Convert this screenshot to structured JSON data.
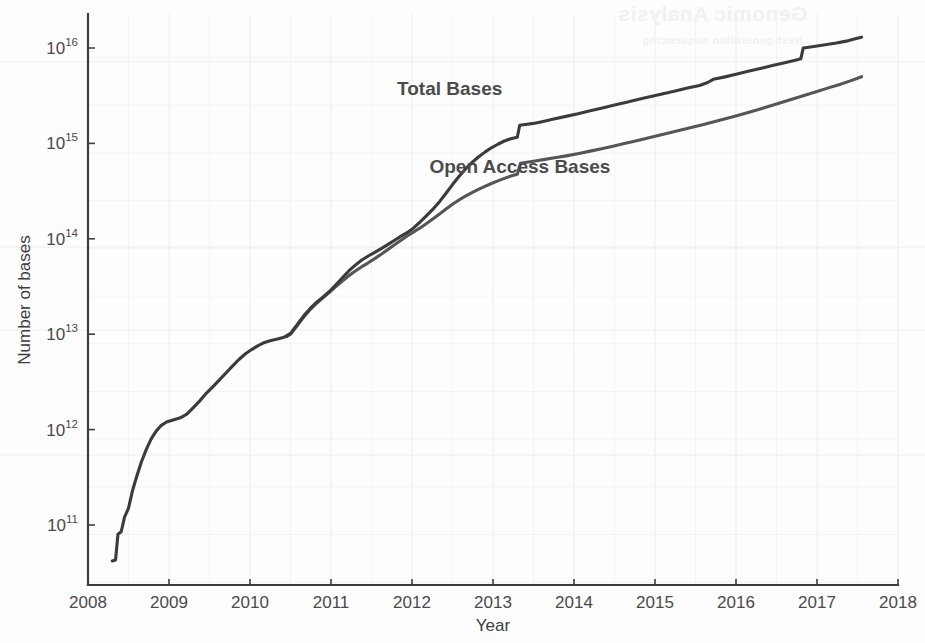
{
  "chart_data": {
    "type": "line",
    "title": "",
    "xlabel": "Year",
    "ylabel": "Number of bases",
    "xlim": [
      2008,
      2018
    ],
    "ylim": [
      40000000000.0,
      2e+16
    ],
    "yscale": "log",
    "grid": true,
    "legend_position": "inline-annotation",
    "xticks": [
      "2008",
      "2009",
      "2010",
      "2011",
      "2012",
      "2013",
      "2014",
      "2015",
      "2016",
      "2017",
      "2018"
    ],
    "yticks": [
      "10^11",
      "10^12",
      "10^13",
      "10^14",
      "10^15",
      "10^16"
    ],
    "ytick_mantissa": "10",
    "ytick_exponents": [
      "11",
      "12",
      "13",
      "14",
      "15",
      "16"
    ],
    "series": [
      {
        "name": "Total Bases",
        "color": "#3b3b3b",
        "label_x": 2013.05,
        "label_y": 2900000000000000.0,
        "points": [
          [
            2008.3,
            42000000000.0
          ],
          [
            2008.34,
            43000000000.0
          ],
          [
            2008.37,
            80000000000.0
          ],
          [
            2008.41,
            85000000000.0
          ],
          [
            2008.45,
            120000000000.0
          ],
          [
            2008.5,
            150000000000.0
          ],
          [
            2008.55,
            230000000000.0
          ],
          [
            2008.6,
            320000000000.0
          ],
          [
            2008.66,
            460000000000.0
          ],
          [
            2008.72,
            620000000000.0
          ],
          [
            2008.78,
            800000000000.0
          ],
          [
            2008.84,
            960000000000.0
          ],
          [
            2008.9,
            1100000000000.0
          ],
          [
            2008.97,
            1200000000000.0
          ],
          [
            2009.05,
            1260000000000.0
          ],
          [
            2009.14,
            1330000000000.0
          ],
          [
            2009.22,
            1450000000000.0
          ],
          [
            2009.3,
            1700000000000.0
          ],
          [
            2009.38,
            2000000000000.0
          ],
          [
            2009.46,
            2400000000000.0
          ],
          [
            2009.54,
            2800000000000.0
          ],
          [
            2009.62,
            3300000000000.0
          ],
          [
            2009.7,
            3900000000000.0
          ],
          [
            2009.78,
            4600000000000.0
          ],
          [
            2009.86,
            5400000000000.0
          ],
          [
            2009.94,
            6200000000000.0
          ],
          [
            2010.02,
            6900000000000.0
          ],
          [
            2010.1,
            7600000000000.0
          ],
          [
            2010.18,
            8200000000000.0
          ],
          [
            2010.26,
            8600000000000.0
          ],
          [
            2010.34,
            8900000000000.0
          ],
          [
            2010.42,
            9300000000000.0
          ],
          [
            2010.5,
            10200000000000.0
          ],
          [
            2010.58,
            12500000000000.0
          ],
          [
            2010.66,
            15500000000000.0
          ],
          [
            2010.74,
            18500000000000.0
          ],
          [
            2010.82,
            21500000000000.0
          ],
          [
            2010.9,
            24500000000000.0
          ],
          [
            2010.98,
            28000000000000.0
          ],
          [
            2011.06,
            33000000000000.0
          ],
          [
            2011.14,
            39000000000000.0
          ],
          [
            2011.22,
            46000000000000.0
          ],
          [
            2011.3,
            53000000000000.0
          ],
          [
            2011.38,
            60000000000000.0
          ],
          [
            2011.46,
            66000000000000.0
          ],
          [
            2011.54,
            72000000000000.0
          ],
          [
            2011.62,
            79000000000000.0
          ],
          [
            2011.7,
            87000000000000.0
          ],
          [
            2011.78,
            96000000000000.0
          ],
          [
            2011.86,
            106000000000000.0
          ],
          [
            2011.94,
            116000000000000.0
          ],
          [
            2012.02,
            130000000000000.0
          ],
          [
            2012.1,
            150000000000000.0
          ],
          [
            2012.18,
            175000000000000.0
          ],
          [
            2012.26,
            205000000000000.0
          ],
          [
            2012.34,
            245000000000000.0
          ],
          [
            2012.42,
            300000000000000.0
          ],
          [
            2012.5,
            370000000000000.0
          ],
          [
            2012.58,
            450000000000000.0
          ],
          [
            2012.66,
            540000000000000.0
          ],
          [
            2012.74,
            630000000000000.0
          ],
          [
            2012.82,
            720000000000000.0
          ],
          [
            2012.9,
            810000000000000.0
          ],
          [
            2012.98,
            900000000000000.0
          ],
          [
            2013.06,
            980000000000000.0
          ],
          [
            2013.14,
            1060000000000000.0
          ],
          [
            2013.22,
            1120000000000000.0
          ],
          [
            2013.3,
            1160000000000000.0
          ],
          [
            2013.33,
            1550000000000000.0
          ],
          [
            2013.4,
            1580000000000000.0
          ],
          [
            2013.5,
            1620000000000000.0
          ],
          [
            2013.62,
            1700000000000000.0
          ],
          [
            2013.75,
            1800000000000000.0
          ],
          [
            2013.9,
            1920000000000000.0
          ],
          [
            2014.05,
            2050000000000000.0
          ],
          [
            2014.2,
            2200000000000000.0
          ],
          [
            2014.35,
            2350000000000000.0
          ],
          [
            2014.5,
            2520000000000000.0
          ],
          [
            2014.65,
            2700000000000000.0
          ],
          [
            2014.8,
            2900000000000000.0
          ],
          [
            2014.95,
            3100000000000000.0
          ],
          [
            2015.1,
            3320000000000000.0
          ],
          [
            2015.25,
            3550000000000000.0
          ],
          [
            2015.4,
            3800000000000000.0
          ],
          [
            2015.55,
            4050000000000000.0
          ],
          [
            2015.65,
            4350000000000000.0
          ],
          [
            2015.72,
            4700000000000000.0
          ],
          [
            2015.85,
            4950000000000000.0
          ],
          [
            2016.0,
            5300000000000000.0
          ],
          [
            2016.15,
            5700000000000000.0
          ],
          [
            2016.3,
            6100000000000000.0
          ],
          [
            2016.45,
            6550000000000000.0
          ],
          [
            2016.6,
            7000000000000000.0
          ],
          [
            2016.72,
            7400000000000000.0
          ],
          [
            2016.8,
            7700000000000000.0
          ],
          [
            2016.83,
            1e+16
          ],
          [
            2016.9,
            1.02e+16
          ],
          [
            2017.0,
            1.05e+16
          ],
          [
            2017.12,
            1.09e+16
          ],
          [
            2017.24,
            1.13e+16
          ],
          [
            2017.36,
            1.18e+16
          ],
          [
            2017.46,
            1.24e+16
          ],
          [
            2017.55,
            1.3e+16
          ]
        ]
      },
      {
        "name": "Open Access Bases",
        "color": "#565656",
        "label_x": 2013.45,
        "label_y": 560000000000000.0,
        "points": [
          [
            2010.45,
            9400000000000.0
          ],
          [
            2010.5,
            10000000000000.0
          ],
          [
            2010.58,
            12200000000000.0
          ],
          [
            2010.66,
            15000000000000.0
          ],
          [
            2010.74,
            18000000000000.0
          ],
          [
            2010.82,
            21000000000000.0
          ],
          [
            2010.9,
            24000000000000.0
          ],
          [
            2010.98,
            27500000000000.0
          ],
          [
            2011.06,
            31500000000000.0
          ],
          [
            2011.14,
            36000000000000.0
          ],
          [
            2011.22,
            41000000000000.0
          ],
          [
            2011.3,
            46000000000000.0
          ],
          [
            2011.38,
            51000000000000.0
          ],
          [
            2011.46,
            56000000000000.0
          ],
          [
            2011.54,
            62000000000000.0
          ],
          [
            2011.62,
            69000000000000.0
          ],
          [
            2011.7,
            77000000000000.0
          ],
          [
            2011.78,
            86000000000000.0
          ],
          [
            2011.86,
            96000000000000.0
          ],
          [
            2011.94,
            107000000000000.0
          ],
          [
            2012.02,
            118000000000000.0
          ],
          [
            2012.1,
            130000000000000.0
          ],
          [
            2012.18,
            145000000000000.0
          ],
          [
            2012.26,
            162000000000000.0
          ],
          [
            2012.34,
            182000000000000.0
          ],
          [
            2012.42,
            205000000000000.0
          ],
          [
            2012.5,
            230000000000000.0
          ],
          [
            2012.58,
            255000000000000.0
          ],
          [
            2012.66,
            280000000000000.0
          ],
          [
            2012.74,
            305000000000000.0
          ],
          [
            2012.82,
            330000000000000.0
          ],
          [
            2012.9,
            355000000000000.0
          ],
          [
            2012.98,
            380000000000000.0
          ],
          [
            2013.06,
            405000000000000.0
          ],
          [
            2013.14,
            430000000000000.0
          ],
          [
            2013.22,
            455000000000000.0
          ],
          [
            2013.3,
            475000000000000.0
          ],
          [
            2013.34,
            620000000000000.0
          ],
          [
            2013.42,
            635000000000000.0
          ],
          [
            2013.52,
            655000000000000.0
          ],
          [
            2013.64,
            680000000000000.0
          ],
          [
            2013.78,
            710000000000000.0
          ],
          [
            2013.92,
            745000000000000.0
          ],
          [
            2014.06,
            785000000000000.0
          ],
          [
            2014.2,
            830000000000000.0
          ],
          [
            2014.34,
            880000000000000.0
          ],
          [
            2014.48,
            935000000000000.0
          ],
          [
            2014.62,
            995000000000000.0
          ],
          [
            2014.76,
            1060000000000000.0
          ],
          [
            2014.9,
            1130000000000000.0
          ],
          [
            2015.04,
            1210000000000000.0
          ],
          [
            2015.18,
            1290000000000000.0
          ],
          [
            2015.32,
            1380000000000000.0
          ],
          [
            2015.46,
            1480000000000000.0
          ],
          [
            2015.6,
            1580000000000000.0
          ],
          [
            2015.74,
            1700000000000000.0
          ],
          [
            2015.88,
            1820000000000000.0
          ],
          [
            2016.02,
            1960000000000000.0
          ],
          [
            2016.16,
            2120000000000000.0
          ],
          [
            2016.3,
            2300000000000000.0
          ],
          [
            2016.44,
            2500000000000000.0
          ],
          [
            2016.58,
            2720000000000000.0
          ],
          [
            2016.72,
            2960000000000000.0
          ],
          [
            2016.86,
            3220000000000000.0
          ],
          [
            2017.0,
            3500000000000000.0
          ],
          [
            2017.14,
            3820000000000000.0
          ],
          [
            2017.28,
            4150000000000000.0
          ],
          [
            2017.42,
            4550000000000000.0
          ],
          [
            2017.55,
            5000000000000000.0
          ]
        ]
      }
    ]
  },
  "ghost_text": [
    {
      "text": "Genomic Analysis",
      "x": 618,
      "y": 2,
      "size": 21
    },
    {
      "text": "Next-generation sequencing",
      "x": 642,
      "y": 34,
      "size": 11
    }
  ]
}
